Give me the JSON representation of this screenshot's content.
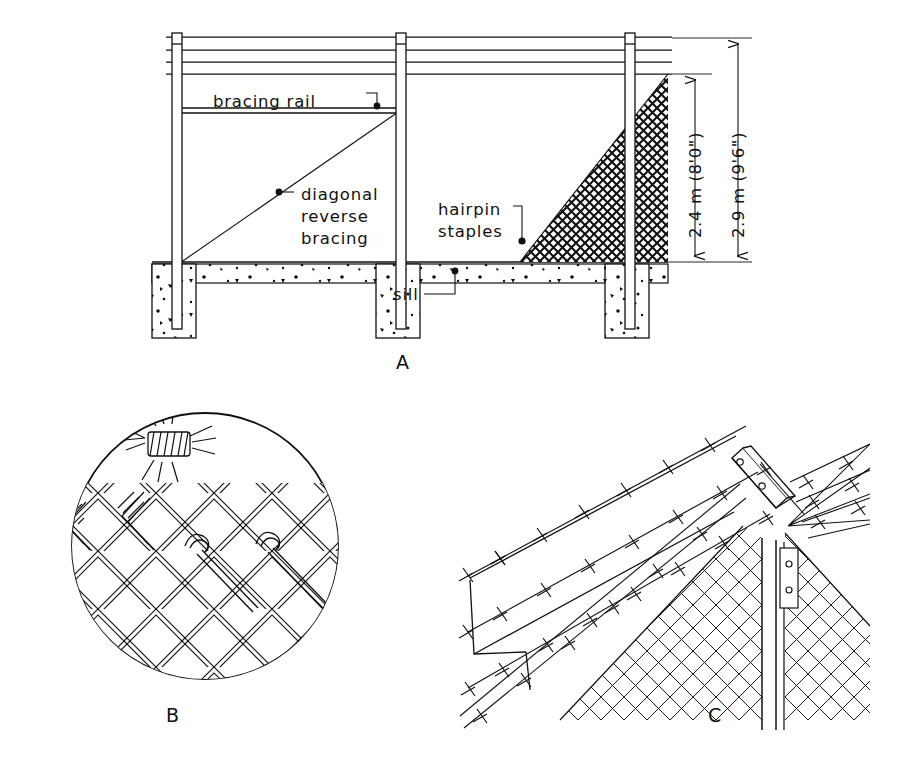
{
  "page": {
    "background": "#ffffff",
    "ink": "#111111",
    "width": 912,
    "height": 762,
    "top_caption": ""
  },
  "figures": [
    {
      "id": "A",
      "label": "A",
      "label_pos": {
        "x": 396,
        "y": 369
      },
      "kind": "elevation-section",
      "description": "Chain link fence elevation with posts, footings, sill, bracing rail and diagonal reverse bracing"
    },
    {
      "id": "B",
      "label": "B",
      "label_pos": {
        "x": 166,
        "y": 714
      },
      "kind": "circular-detail",
      "description": "Circular detail of chain link mesh with barbed wire knot and hairpin staples"
    },
    {
      "id": "C",
      "label": "C",
      "label_pos": {
        "x": 714,
        "y": 714
      },
      "kind": "perspective-detail",
      "description": "Perspective detail of barbed wire extension arm on post with chain link fabric"
    }
  ],
  "figureA": {
    "callouts": [
      {
        "id": "bracing-rail",
        "lines": [
          "bracing rail"
        ],
        "x": 213,
        "y": 101,
        "anchor": "start"
      },
      {
        "id": "diagonal-bracing",
        "lines": [
          "diagonal",
          "reverse",
          "bracing"
        ],
        "x": 301,
        "y": 196,
        "anchor": "start"
      },
      {
        "id": "hairpin-staples",
        "lines": [
          "hairpin",
          "staples"
        ],
        "x": 438,
        "y": 211,
        "anchor": "start"
      },
      {
        "id": "sill",
        "lines": [
          "sill"
        ],
        "x": 393,
        "y": 298,
        "anchor": "start"
      }
    ],
    "dimensions": [
      {
        "id": "fabric-height",
        "text": "2.4 m (8'0\")",
        "x": 698,
        "y": 168,
        "top": 74,
        "bottom": 262,
        "line_x": 695
      },
      {
        "id": "overall-height",
        "text": "2.9 m (9'6\")",
        "x": 741,
        "y": 150,
        "top": 38,
        "bottom": 262,
        "line_x": 738
      }
    ],
    "posts": [
      {
        "id": "post-left",
        "x": 172
      },
      {
        "id": "post-middle",
        "x": 396
      },
      {
        "id": "post-right",
        "x": 625
      }
    ],
    "wire_strands_y": [
      37,
      50,
      62,
      74
    ],
    "bracing_rail_y": 108,
    "ground_y": 262,
    "sill_bottom_y": 283,
    "footing_bottom_y": 338
  }
}
